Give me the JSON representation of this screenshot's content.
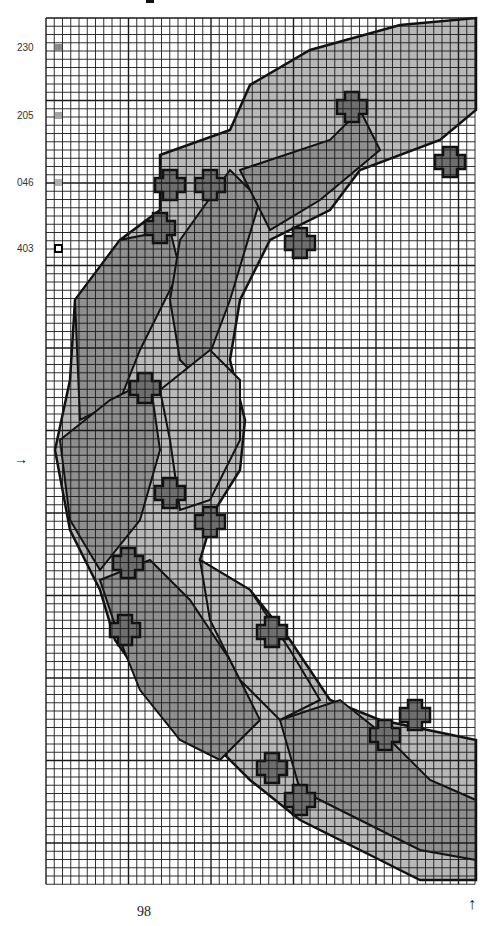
{
  "chart": {
    "grid": {
      "left": 46,
      "top": 18,
      "cell": 8.25,
      "cols": 52,
      "rows": 105
    },
    "colors": {
      "grid": "#1a1a1a",
      "outline": "#111111",
      "leaf_dark": "#8f8f8f",
      "leaf_light": "#b8b8b8",
      "berry": "#6e6e6e",
      "background": "#ffffff"
    }
  },
  "legend": [
    {
      "code": "230",
      "top": 42,
      "color": "#8a8a8a",
      "style": "filled"
    },
    {
      "code": "205",
      "top": 110,
      "color": "#a5a5a5",
      "style": "filled"
    },
    {
      "code": "046",
      "top": 177,
      "color": "#b0b0b0",
      "style": "filled"
    },
    {
      "code": "403",
      "top": 243,
      "color": "#ffffff",
      "style": "outline"
    }
  ],
  "markers": {
    "center_row_arrow": "→",
    "center_col_arrow": "↑"
  },
  "page_number": "98"
}
